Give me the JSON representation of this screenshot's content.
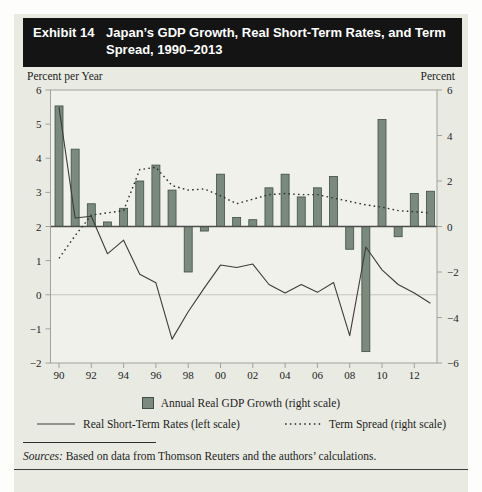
{
  "header": {
    "exhibit_label": "Exhibit 14",
    "title": "Japan’s GDP Growth, Real Short-Term Rates, and Term Spread, 1990–2013"
  },
  "axes": {
    "left_caption": "Percent per Year",
    "right_caption": "Percent",
    "left_ticks": [
      6,
      5,
      4,
      3,
      2,
      1,
      0,
      -1,
      -2
    ],
    "right_ticks": [
      6,
      4,
      2,
      0,
      -2,
      -4,
      -6
    ],
    "x_tick_labels": [
      "90",
      "92",
      "94",
      "96",
      "98",
      "00",
      "02",
      "04",
      "06",
      "08",
      "10",
      "12"
    ]
  },
  "legend": {
    "gdp_label": "Annual Real GDP Growth (right scale)",
    "rates_label": "Real Short-Term Rates (left scale)",
    "spread_label": "Term Spread (right scale)"
  },
  "sources": {
    "label": "Sources:",
    "text": " Based on data from Thomson Reuters and the authors’ calculations."
  },
  "colors": {
    "card_bg": "#e9ebe3",
    "plot_bg": "#f0f1eb",
    "header_bg": "#141414",
    "bar_fill": "#7a8a7d",
    "bar_stroke": "#3f4f45",
    "solid_line": "#3c3c3c",
    "dotted_line": "#2e2e2e",
    "frame": "#9a9a96",
    "baseline": "#4c4c4c",
    "zero_line": "#c4c6bf",
    "tick_text": "#222222"
  },
  "chart_data": {
    "type": "bar",
    "title": "Japan’s GDP Growth, Real Short-Term Rates, and Term Spread, 1990–2013",
    "years": [
      1990,
      1991,
      1992,
      1993,
      1994,
      1995,
      1996,
      1997,
      1998,
      1999,
      2000,
      2001,
      2002,
      2003,
      2004,
      2005,
      2006,
      2007,
      2008,
      2009,
      2010,
      2011,
      2012,
      2013
    ],
    "left_axis": {
      "label": "Percent per Year",
      "range": [
        -2,
        6
      ],
      "applies_to": "Real Short-Term Rates"
    },
    "right_axis": {
      "label": "Percent",
      "range": [
        -6,
        6
      ],
      "applies_to": "Annual Real GDP Growth, Term Spread"
    },
    "grid": "zero-line-only",
    "legend_position": "bottom-center",
    "series": [
      {
        "name": "Annual Real GDP Growth",
        "type": "bar",
        "axis": "right",
        "values": [
          5.3,
          3.4,
          1.0,
          0.2,
          0.8,
          2.0,
          2.7,
          1.6,
          -2.0,
          -0.2,
          2.3,
          0.4,
          0.3,
          1.7,
          2.3,
          1.3,
          1.7,
          2.2,
          -1.0,
          -5.5,
          4.7,
          -0.45,
          1.45,
          1.55
        ]
      },
      {
        "name": "Real Short-Term Rates",
        "type": "line",
        "axis": "left",
        "values": [
          5.5,
          2.25,
          2.3,
          1.2,
          1.6,
          0.6,
          0.35,
          -1.3,
          -0.5,
          0.2,
          0.87,
          0.8,
          0.9,
          0.3,
          0.05,
          0.3,
          0.07,
          0.36,
          -1.2,
          1.4,
          0.73,
          0.3,
          0.05,
          -0.25
        ]
      },
      {
        "name": "Term Spread",
        "type": "dotted-line",
        "axis": "right",
        "values": [
          -1.4,
          -0.4,
          0.5,
          0.6,
          0.7,
          2.5,
          2.6,
          1.8,
          1.6,
          1.65,
          1.35,
          1.0,
          1.2,
          1.4,
          1.45,
          1.4,
          1.4,
          1.25,
          1.1,
          0.95,
          0.85,
          0.7,
          0.65,
          0.6
        ]
      }
    ]
  }
}
